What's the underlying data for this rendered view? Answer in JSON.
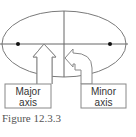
{
  "figure": {
    "caption": "Figure 12.3.3",
    "labels": {
      "major_line1": "Major",
      "major_line2": "axis",
      "minor_line1": "Minor",
      "minor_line2": "axis"
    },
    "colors": {
      "line": "#7a7a7a",
      "axis": "#666666",
      "focus": "#111111",
      "text": "#333333"
    }
  }
}
